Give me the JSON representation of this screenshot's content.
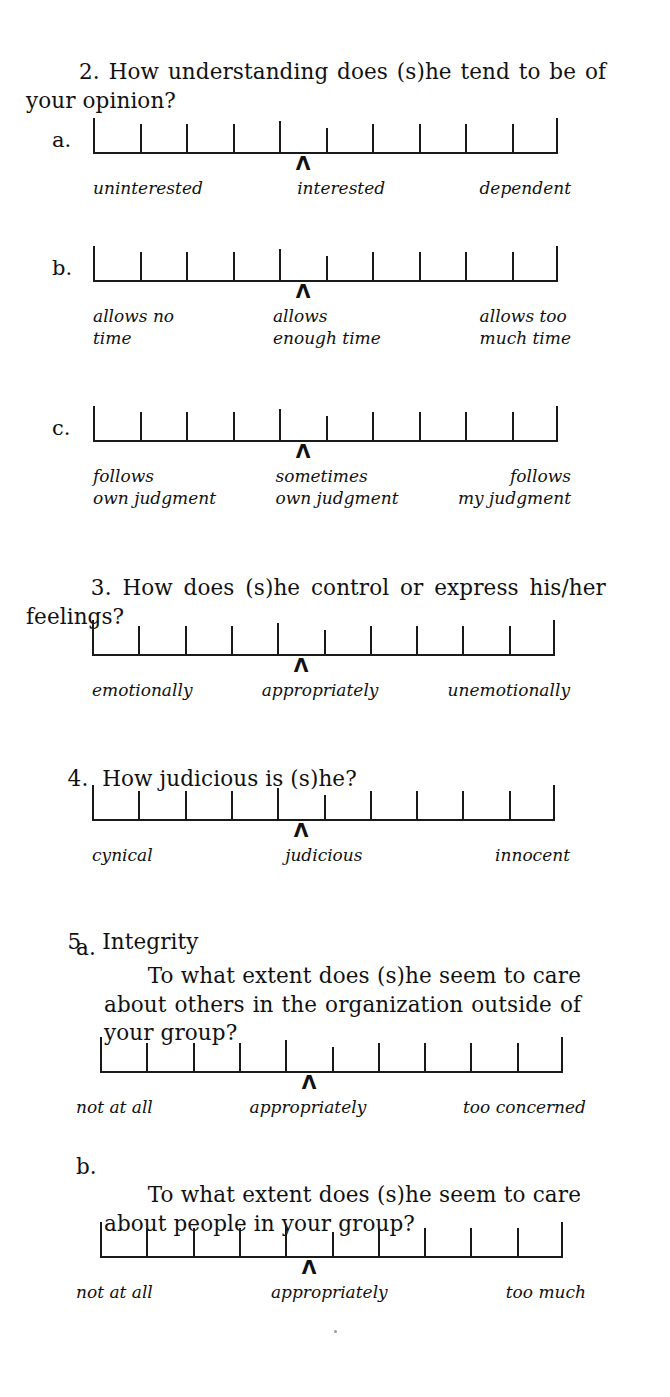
{
  "document": {
    "type": "questionnaire-page",
    "scale_tick_count": 11,
    "scale_marker_glyph": "Λ"
  },
  "questions": [
    {
      "number": "2.",
      "text": "How understanding does (s)he tend to be of your opinion?",
      "items": [
        {
          "letter": "a.",
          "anchors": {
            "left": "uninterested",
            "center": "interested",
            "right": "dependent"
          }
        },
        {
          "letter": "b.",
          "anchors": {
            "left": "allows no\ntime",
            "center": "allows\nenough time",
            "right": "allows too\nmuch time"
          }
        },
        {
          "letter": "c.",
          "anchors": {
            "left": "follows\nown judgment",
            "center": "sometimes\nown judgment",
            "right": "follows\nmy judgment"
          }
        }
      ]
    },
    {
      "number": "3.",
      "text": "How does (s)he control or express his/her feelings?",
      "items": [
        {
          "letter": "",
          "anchors": {
            "left": "emotionally",
            "center": "appropriately",
            "right": "unemotionally"
          }
        }
      ]
    },
    {
      "number": "4.",
      "text": "How judicious is (s)he?",
      "items": [
        {
          "letter": "",
          "anchors": {
            "left": "cynical",
            "center": "judicious",
            "right": "innocent"
          }
        }
      ]
    },
    {
      "number": "5.",
      "text": "Integrity",
      "subitems": [
        {
          "letter": "a.",
          "text": "To what extent does (s)he seem to care about others in the organization outside of your group?",
          "anchors": {
            "left": "not at all",
            "center": "appropriately",
            "right": "too concerned"
          }
        },
        {
          "letter": "b.",
          "text": "To what extent does (s)he seem to care about people in your group?",
          "anchors": {
            "left": "not at all",
            "center": "appropriately",
            "right": "too much"
          }
        }
      ]
    }
  ]
}
